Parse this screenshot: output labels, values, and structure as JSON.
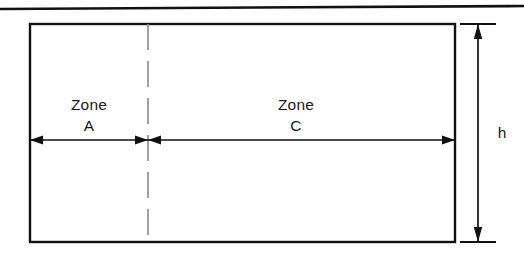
{
  "figure": {
    "type": "engineering-dimension-diagram",
    "background_color": "#ffffff",
    "line_color": "#111111",
    "centerline_color": "#8a8a8a",
    "text_color": "#1a1a1a"
  },
  "top_rule": {
    "name": "top-border-rule",
    "x1": 0,
    "y1": 9,
    "x2": 524,
    "y2": 6,
    "stroke_width": 2.6
  },
  "rectangle": {
    "name": "section-outline",
    "x": 30,
    "y": 24,
    "width": 425,
    "height": 218,
    "stroke_width": 2.4
  },
  "centerline": {
    "name": "zone-divider-centerline",
    "x": 148,
    "y_top": 24,
    "y_bottom": 242,
    "dash_pattern": "26 11",
    "stroke_width": 1.6
  },
  "horizontal_dimension": {
    "y": 140,
    "zones": [
      {
        "id": "zone-a",
        "label_line1": "Zone",
        "label_line2": "A",
        "label_x": 89,
        "label_y1": 110,
        "label_y2": 131,
        "x_start": 30,
        "x_end": 148,
        "arrow_start": true,
        "arrow_end": true
      },
      {
        "id": "zone-c",
        "label_line1": "Zone",
        "label_line2": "C",
        "label_x": 296,
        "label_y1": 110,
        "label_y2": 131,
        "x_start": 148,
        "x_end": 455,
        "arrow_start": true,
        "arrow_end": true
      }
    ]
  },
  "vertical_dimension": {
    "id": "height-dimension",
    "label": "h",
    "label_x": 502,
    "label_y": 138,
    "x": 478,
    "y_top": 24,
    "y_bottom": 242,
    "extension_lines": [
      {
        "name": "top-extension-line",
        "x1": 460,
        "x2": 496,
        "y": 24
      },
      {
        "name": "bottom-extension-line",
        "x1": 460,
        "x2": 496,
        "y": 242
      }
    ],
    "arrow_top": true,
    "arrow_bottom": true
  }
}
